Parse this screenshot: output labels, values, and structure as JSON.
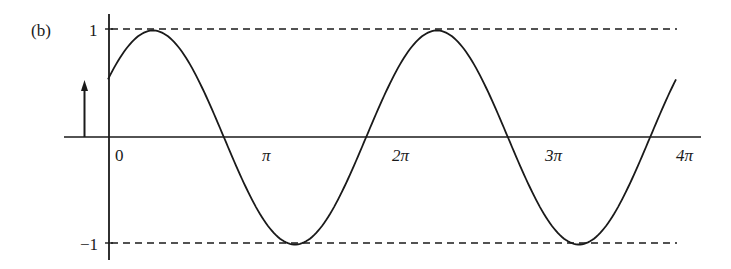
{
  "figure": {
    "panel_label": "(b)",
    "y_ticks": [
      {
        "value": 1,
        "label": "1"
      },
      {
        "value": -1,
        "label": "−1"
      }
    ],
    "x_ticks": [
      {
        "value": 0,
        "label": "0"
      },
      {
        "value": 3.14159,
        "label": "π"
      },
      {
        "value": 6.28318,
        "label": "2π"
      },
      {
        "value": 9.42478,
        "label": "3π"
      },
      {
        "value": 12.56637,
        "label": "4π"
      }
    ],
    "colors": {
      "line": "#1a1a1a",
      "background": "#ffffff"
    }
  },
  "chart_data": {
    "type": "line",
    "title": "(b)",
    "xlabel": "",
    "ylabel": "",
    "xlim": [
      -0.7,
      13.7
    ],
    "ylim": [
      -1.15,
      1.15
    ],
    "grid": false,
    "legend": null,
    "series": [
      {
        "name": "sinusoid",
        "expression": "y = sin(t + φ), φ ≈ π/6 (initial value ≈ 0.54)",
        "x": [
          0,
          1.0,
          2.0,
          2.62,
          3.0,
          4.0,
          5.0,
          5.76,
          6.0,
          7.0,
          8.0,
          8.9,
          9.0,
          10.0,
          11.0,
          12.04,
          12.6
        ],
        "values": [
          0.54,
          1.0,
          0.5,
          0.0,
          -0.35,
          -0.97,
          -0.49,
          0.0,
          0.24,
          0.97,
          0.56,
          0.0,
          -0.08,
          -0.91,
          -0.7,
          0.0,
          0.45
        ]
      }
    ],
    "reference_lines": [
      {
        "type": "hline",
        "y": 1,
        "style": "dashed"
      },
      {
        "type": "hline",
        "y": -1,
        "style": "dashed"
      }
    ],
    "annotations": [
      {
        "type": "arrow",
        "x": -0.5,
        "from_y": 0,
        "to_y": 0.54,
        "text": "initial value arrow"
      }
    ]
  }
}
